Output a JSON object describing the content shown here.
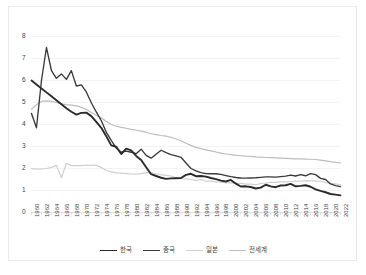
{
  "chart_data": {
    "type": "line",
    "title": "",
    "subtitle": "",
    "xlabel": "",
    "ylabel": "",
    "xlim": [
      1960,
      2022
    ],
    "ylim": [
      0,
      8
    ],
    "grid": "horizontal",
    "legend_position": "bottom",
    "y_ticks": [
      0,
      1,
      2,
      3,
      4,
      5,
      6,
      7,
      8
    ],
    "x_ticks": [
      "1960",
      "1962",
      "1964",
      "1966",
      "1968",
      "1970",
      "1972",
      "1974",
      "1976",
      "1978",
      "1980",
      "1982",
      "1984",
      "1986",
      "1988",
      "1990",
      "1992",
      "1994",
      "1996",
      "1998",
      "2000",
      "2002",
      "2004",
      "2006",
      "2008",
      "2010",
      "2012",
      "2014",
      "2016",
      "2018",
      "2020",
      "2022"
    ],
    "x": [
      1960,
      1961,
      1962,
      1963,
      1964,
      1965,
      1966,
      1967,
      1968,
      1969,
      1970,
      1971,
      1972,
      1973,
      1974,
      1975,
      1976,
      1977,
      1978,
      1979,
      1980,
      1981,
      1982,
      1983,
      1984,
      1985,
      1986,
      1987,
      1988,
      1989,
      1990,
      1991,
      1992,
      1993,
      1994,
      1995,
      1996,
      1997,
      1998,
      1999,
      2000,
      2001,
      2002,
      2003,
      2004,
      2005,
      2006,
      2007,
      2008,
      2009,
      2010,
      2011,
      2012,
      2013,
      2014,
      2015,
      2016,
      2017,
      2018,
      2019,
      2020,
      2021,
      2022
    ],
    "series": [
      {
        "name": "한국",
        "color": "#2b2b2b",
        "width": 1.9,
        "values": [
          6.0,
          5.82,
          5.64,
          5.46,
          5.28,
          5.1,
          4.92,
          4.74,
          4.58,
          4.45,
          4.53,
          4.54,
          4.38,
          4.12,
          3.85,
          3.47,
          3.05,
          2.99,
          2.66,
          2.9,
          2.82,
          2.57,
          2.39,
          2.06,
          1.74,
          1.66,
          1.58,
          1.53,
          1.55,
          1.56,
          1.57,
          1.71,
          1.76,
          1.65,
          1.66,
          1.63,
          1.57,
          1.52,
          1.45,
          1.41,
          1.48,
          1.31,
          1.18,
          1.19,
          1.16,
          1.09,
          1.13,
          1.26,
          1.19,
          1.15,
          1.23,
          1.24,
          1.3,
          1.19,
          1.21,
          1.24,
          1.17,
          1.05,
          0.98,
          0.92,
          0.84,
          0.81,
          0.78
        ]
      },
      {
        "name": "중국",
        "color": "#3a3a3a",
        "width": 1.35,
        "values": [
          4.5,
          3.85,
          6.0,
          7.5,
          6.45,
          6.1,
          6.3,
          6.05,
          6.45,
          5.75,
          5.8,
          5.48,
          4.99,
          4.57,
          4.18,
          3.65,
          3.28,
          2.93,
          2.74,
          2.79,
          2.74,
          2.67,
          2.88,
          2.6,
          2.47,
          2.65,
          2.83,
          2.72,
          2.63,
          2.57,
          2.51,
          2.25,
          2.0,
          1.89,
          1.81,
          1.77,
          1.76,
          1.76,
          1.73,
          1.68,
          1.63,
          1.59,
          1.57,
          1.56,
          1.57,
          1.58,
          1.6,
          1.62,
          1.62,
          1.61,
          1.63,
          1.65,
          1.7,
          1.66,
          1.72,
          1.67,
          1.77,
          1.72,
          1.55,
          1.5,
          1.3,
          1.22,
          1.18
        ]
      },
      {
        "name": "일본",
        "color": "#cfcfcf",
        "width": 1.2,
        "values": [
          2.0,
          1.97,
          1.98,
          2.0,
          2.05,
          2.14,
          1.58,
          2.23,
          2.13,
          2.13,
          2.13,
          2.16,
          2.14,
          2.14,
          2.05,
          1.91,
          1.85,
          1.8,
          1.79,
          1.77,
          1.75,
          1.74,
          1.77,
          1.8,
          1.81,
          1.76,
          1.72,
          1.69,
          1.66,
          1.57,
          1.54,
          1.53,
          1.5,
          1.46,
          1.5,
          1.42,
          1.43,
          1.39,
          1.38,
          1.34,
          1.36,
          1.33,
          1.32,
          1.29,
          1.29,
          1.26,
          1.32,
          1.34,
          1.37,
          1.37,
          1.39,
          1.39,
          1.41,
          1.43,
          1.42,
          1.45,
          1.44,
          1.43,
          1.42,
          1.36,
          1.33,
          1.3,
          1.26
        ]
      },
      {
        "name": "전세계",
        "color": "#bdbdbd",
        "width": 1.2,
        "values": [
          4.7,
          4.9,
          5.05,
          5.07,
          5.05,
          5.0,
          4.94,
          4.9,
          4.88,
          4.85,
          4.78,
          4.68,
          4.55,
          4.42,
          4.3,
          4.15,
          4.0,
          3.92,
          3.87,
          3.83,
          3.78,
          3.74,
          3.7,
          3.65,
          3.58,
          3.54,
          3.5,
          3.47,
          3.42,
          3.34,
          3.26,
          3.15,
          3.05,
          2.96,
          2.9,
          2.85,
          2.8,
          2.75,
          2.7,
          2.66,
          2.63,
          2.6,
          2.58,
          2.56,
          2.55,
          2.53,
          2.52,
          2.5,
          2.49,
          2.48,
          2.47,
          2.46,
          2.45,
          2.44,
          2.44,
          2.43,
          2.42,
          2.41,
          2.38,
          2.35,
          2.31,
          2.28,
          2.25
        ]
      }
    ],
    "legend": [
      {
        "label": "한국",
        "color": "#2b2b2b",
        "width": 1.9
      },
      {
        "label": "중국",
        "color": "#3a3a3a",
        "width": 1.35
      },
      {
        "label": "일본",
        "color": "#cfcfcf",
        "width": 1.2
      },
      {
        "label": "전세계",
        "color": "#bdbdbd",
        "width": 1.2
      }
    ],
    "axis_color": "#d9d9d9",
    "grid_color": "#eeeeee",
    "tick_label_color": "#3f3f3f",
    "background": "#ffffff"
  }
}
